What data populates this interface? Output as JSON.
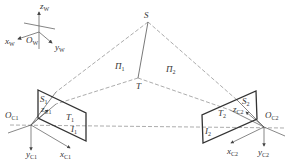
{
  "diagram": {
    "type": "stereo-vision-geometry",
    "world_frame": {
      "origin": "O_W",
      "axes": [
        "x_W",
        "y_W",
        "z_W"
      ]
    },
    "points": {
      "S": "S",
      "T": "T"
    },
    "planes": [
      "Π1",
      "Π2"
    ],
    "cameras": [
      {
        "id": "C1",
        "origin": "O_C1",
        "axes": [
          "x_C1",
          "y_C1",
          "z_C1"
        ],
        "image_points": [
          "S1",
          "T1"
        ],
        "image_plane": "I1"
      },
      {
        "id": "C2",
        "origin": "O_C2",
        "axes": [
          "x_C2",
          "y_C2",
          "z_C2"
        ],
        "image_points": [
          "S2",
          "T2"
        ],
        "image_plane": "I2"
      }
    ]
  },
  "labels": {
    "zw": "z",
    "zw_sub": "W",
    "xw": "x",
    "xw_sub": "W",
    "ow": "O",
    "ow_sub": "W",
    "yw": "y",
    "yw_sub": "W",
    "S": "S",
    "T": "T",
    "pi1": "Π",
    "pi1_sub": "1",
    "pi2": "Π",
    "pi2_sub": "2",
    "oc1": "O",
    "oc1_sub": "C1",
    "s1": "S",
    "s1_sub": "1",
    "zc1": "z",
    "zc1_sub": "C1",
    "t1": "T",
    "t1_sub": "1",
    "i1": "I",
    "i1_sub": "1",
    "yc1": "y",
    "yc1_sub": "C1",
    "xc1": "x",
    "xc1_sub": "C1",
    "oc2": "O",
    "oc2_sub": "C2",
    "s2": "S",
    "s2_sub": "2",
    "zc2": "z",
    "zc2_sub": "C2",
    "t2": "T",
    "t2_sub": "2",
    "i2": "I",
    "i2_sub": "2",
    "yc2": "y",
    "yc2_sub": "C2",
    "xc2": "x",
    "xc2_sub": "C2"
  },
  "colors": {
    "line": "#555555",
    "plane": "#333333",
    "dash": "#888888"
  }
}
